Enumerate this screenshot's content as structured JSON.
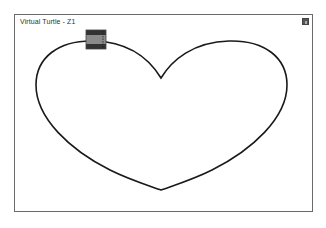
{
  "window": {
    "title": "Virtual Turtle - Z1"
  },
  "canvas": {
    "drawing": "heart",
    "stroke_color": "#1a1a1a",
    "background": "#ffffff"
  },
  "turtle": {
    "x": 96,
    "y": 40,
    "body_color": "#8a8a8a",
    "band_color": "#333333"
  },
  "icons": {
    "corner_button": "maximize-icon"
  }
}
